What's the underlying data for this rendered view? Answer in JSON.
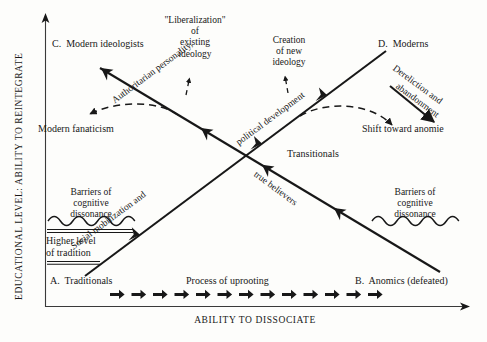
{
  "figure": {
    "type": "conceptual-diagram",
    "background_color": "#fdfdfb",
    "ink_color": "#181818"
  },
  "axes": {
    "y_label": "EDUCATIONAL LEVEL: ABILITY TO REINTEGRATE",
    "x_label": "ABILITY TO DISSOCIATE"
  },
  "corners": {
    "top_left": "C.  Modern ideologists",
    "top_right": "D.  Moderns",
    "bottom_left": "A.  Traditionals",
    "bottom_right": "B.  Anomics (defeated)"
  },
  "annotations": {
    "liberalization": "\"Liberalization\"\nof\nexisting\nideology",
    "creation_new_ideology": "Creation\nof new\nideology",
    "modern_fanaticism": "Modern fanaticism",
    "shift_toward_anomie": "Shift toward anomie",
    "transitionals": "Transitionals",
    "barriers_left": "Barriers of\ncognitive\ndissonance",
    "barriers_right": "Barriers of\ncognitive\ndissonance",
    "higher_level_tradition": "Higher level\nof tradition",
    "process_of_uprooting": "Process of uprooting"
  },
  "diagonal_labels": {
    "authoritarian": "Authoritarian personality,",
    "political_development": "political development",
    "social_mobilization": "Social mobilization and",
    "true_believers": "true believers",
    "dereliction": "Dereliction and",
    "abandonment": "abandonment"
  },
  "uprooting_arrow_count": 13,
  "icons": {
    "wave_left": "wavy-barrier-icon",
    "wave_right": "wavy-barrier-icon",
    "axis_arrow_x": "arrow-right-icon",
    "axis_arrow_y": "arrow-up-icon"
  }
}
